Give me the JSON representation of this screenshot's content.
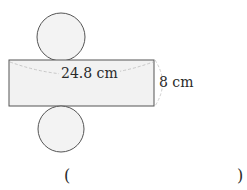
{
  "diagram": {
    "type": "cylinder-net",
    "shapes": {
      "top_circle": {
        "cx": 61,
        "cy": 37,
        "r": 24
      },
      "rectangle": {
        "x": 9,
        "y": 60,
        "width": 145,
        "height": 46
      },
      "bottom_circle": {
        "cx": 61,
        "cy": 129,
        "r": 23
      }
    },
    "labels": {
      "length": "24.8 cm",
      "height": "8 cm"
    },
    "answer": {
      "open_paren": "(",
      "close_paren": ")",
      "value": ""
    },
    "colors": {
      "stroke": "#555555",
      "fill": "#f2f2f2",
      "dashed": "#c8c8c8",
      "text": "#2a2a2a"
    }
  }
}
